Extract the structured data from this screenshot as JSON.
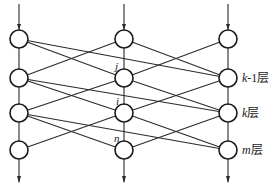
{
  "diagram": {
    "colors": {
      "line": "#2a2a2a",
      "node_stroke": "#1a1a1a",
      "node_fill": "#ffffff",
      "background": "#ffffff"
    },
    "columns": [
      {
        "id": "left",
        "x": 19
      },
      {
        "id": "middle",
        "x": 124
      },
      {
        "id": "right",
        "x": 228
      }
    ],
    "layers": [
      {
        "index": 0,
        "y": 39,
        "label": ""
      },
      {
        "index": 1,
        "y": 78,
        "label_var": "k",
        "label_suffix": "-1层",
        "label": "k-1层"
      },
      {
        "index": 2,
        "y": 113,
        "label_var": "k",
        "label_suffix": "层",
        "label": "k层"
      },
      {
        "index": 3,
        "y": 150,
        "label_var": "m",
        "label_suffix": "层",
        "label": "m层"
      }
    ],
    "node_labels": {
      "j": "j",
      "i": "i",
      "n": "n"
    },
    "edges_between_layers": [
      [
        "left",
        "middle"
      ],
      [
        "left",
        "right"
      ],
      [
        "middle",
        "left"
      ],
      [
        "middle",
        "right"
      ],
      [
        "right",
        "middle"
      ]
    ],
    "input_arrows": [
      "left",
      "middle",
      "right"
    ],
    "output_arrows": [
      "left",
      "middle",
      "right"
    ]
  }
}
